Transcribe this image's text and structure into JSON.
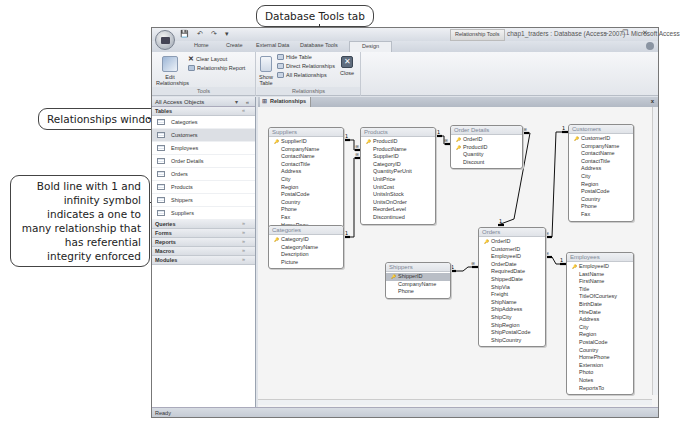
{
  "callouts": {
    "database_tools_tab": "Database Tools tab",
    "relationships_window": "Relationships window",
    "bold_line": "Bold line with 1 and infinity symbol indicates a one to many relationship that has referential integrity enforced"
  },
  "window": {
    "contextual_tab": "Relationship Tools",
    "title": "chap1_traders : Database (Access 2007) - Microsoft Access",
    "controls": "– ❐ ✕",
    "quick_access": "💾 ↶ ↷ ▾"
  },
  "ribbon_tabs": [
    "Home",
    "Create",
    "External Data",
    "Database Tools",
    "Design"
  ],
  "ribbon": {
    "tools": {
      "label": "Tools",
      "edit_relationships": "Edit Relationships",
      "clear_layout": "Clear Layout",
      "relationship_report": "Relationship Report"
    },
    "relationships": {
      "label": "Relationships",
      "show_table": "Show Table",
      "hide_table": "Hide Table",
      "direct_relationships": "Direct Relationships",
      "all_relationships": "All Relationships",
      "close": "Close"
    }
  },
  "nav_pane": {
    "header": "All Access Objects",
    "header_ctrl": "▾ «",
    "tables_label": "Tables",
    "tables": [
      "Categories",
      "Customers",
      "Employees",
      "Order Details",
      "Orders",
      "Products",
      "Shippers",
      "Suppliers"
    ],
    "selected_table": "Customers",
    "groups": [
      "Queries",
      "Forms",
      "Reports",
      "Macros",
      "Modules"
    ],
    "chevron": "¥"
  },
  "document": {
    "tab_label": "Relationships",
    "close": "x"
  },
  "tables": {
    "suppliers": {
      "title": "Suppliers",
      "fields": [
        "SupplierID",
        "CompanyName",
        "ContactName",
        "ContactTitle",
        "Address",
        "City",
        "Region",
        "PostalCode",
        "Country",
        "Phone",
        "Fax",
        "HomePage"
      ]
    },
    "products": {
      "title": "Products",
      "fields": [
        "ProductID",
        "ProductName",
        "SupplierID",
        "CategoryID",
        "QuantityPerUnit",
        "UnitPrice",
        "UnitCost",
        "UnitsInStock",
        "UnitsOnOrder",
        "ReorderLevel",
        "Discontinued"
      ]
    },
    "order_details": {
      "title": "Order Details",
      "fields": [
        "OrderID",
        "ProductID",
        "Quantity",
        "Discount"
      ]
    },
    "customers": {
      "title": "Customers",
      "fields": [
        "CustomerID",
        "CompanyName",
        "ContactName",
        "ContactTitle",
        "Address",
        "City",
        "Region",
        "PostalCode",
        "Country",
        "Phone",
        "Fax"
      ]
    },
    "categories": {
      "title": "Categories",
      "fields": [
        "CategoryID",
        "CategoryName",
        "Description",
        "Picture"
      ]
    },
    "shippers": {
      "title": "Shippers",
      "fields": [
        "ShipperID",
        "CompanyName",
        "Phone"
      ]
    },
    "orders": {
      "title": "Orders",
      "fields": [
        "OrderID",
        "CustomerID",
        "EmployeeID",
        "OrderDate",
        "RequiredDate",
        "ShippedDate",
        "ShipVia",
        "Freight",
        "ShipName",
        "ShipAddress",
        "ShipCity",
        "ShipRegion",
        "ShipPostalCode",
        "ShipCountry"
      ]
    },
    "employees": {
      "title": "Employees",
      "fields": [
        "EmployeeID",
        "LastName",
        "FirstName",
        "Title",
        "TitleOfCourtesy",
        "BirthDate",
        "HireDate",
        "Address",
        "City",
        "Region",
        "PostalCode",
        "Country",
        "HomePhone",
        "Extension",
        "Photo",
        "Notes",
        "ReportsTo"
      ]
    }
  },
  "relationship_labels": {
    "one": "1",
    "many": "∞"
  },
  "status": "Ready"
}
